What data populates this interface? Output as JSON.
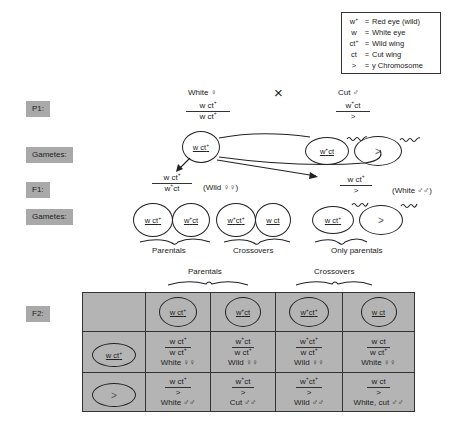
{
  "legend": [
    {
      "symbol": "w+",
      "eq": "=",
      "meaning": "Red eye (wild)"
    },
    {
      "symbol": "w",
      "eq": "=",
      "meaning": "White eye"
    },
    {
      "symbol": "ct+",
      "eq": "=",
      "meaning": "Wild wing"
    },
    {
      "symbol": "ct",
      "eq": "=",
      "meaning": "Cut wing"
    },
    {
      "symbol": ">",
      "eq": "=",
      "meaning": "y Chromosome"
    }
  ],
  "row_labels": {
    "p1": "P1:",
    "gametes1": "Gametes:",
    "f1": "F1:",
    "gametes2": "Gametes:",
    "f2": "F2:"
  },
  "p1": {
    "female_label": "White ♀",
    "female_num": "w ct+",
    "female_den": "w ct+",
    "cross_symbol": "×",
    "male_label": "Cut ♂",
    "male_num": "w+ct",
    "male_den": ">"
  },
  "gametes1": {
    "female": "w ct+",
    "male_x": "w+ct",
    "male_y": ">"
  },
  "f1": {
    "female_num": "w ct+",
    "female_den": "w+ct",
    "female_label": "(Wild ♀♀)",
    "male_num": "w ct+",
    "male_den": ">",
    "male_label": "(White ♂♂)"
  },
  "gametes2": {
    "female": [
      "w ct+",
      "w+ct",
      "w+ct+",
      "w ct"
    ],
    "parentals_label": "Parentals",
    "crossovers_label": "Crossovers",
    "male": [
      "w ct+",
      ">"
    ],
    "only_parentals_label": "Only parentals"
  },
  "f2": {
    "parentals_label": "Parentals",
    "crossovers_label": "Crossovers",
    "column_gametes": [
      "w ct+",
      "w+ct",
      "w+ct+",
      "w ct"
    ],
    "rows": [
      {
        "gamete": "w ct+",
        "cells": [
          {
            "num": "w ct+",
            "den": "w ct+",
            "pheno": "White ♀♀"
          },
          {
            "num": "w+ct",
            "den": "w ct+",
            "pheno": "Wild ♀♀"
          },
          {
            "num": "w+ct+",
            "den": "w ct+",
            "pheno": "Wild ♀♀"
          },
          {
            "num": "w ct",
            "den": "w ct+",
            "pheno": "White ♀♀"
          }
        ]
      },
      {
        "gamete": ">",
        "cells": [
          {
            "num": "w ct+",
            "den": ">",
            "pheno": "White ♂♂"
          },
          {
            "num": "w+ct",
            "den": ">",
            "pheno": "Cut ♂♂"
          },
          {
            "num": "w+ct+",
            "den": ">",
            "pheno": "Wild ♂♂"
          },
          {
            "num": "w ct",
            "den": ">",
            "pheno": "White, cut ♂♂"
          }
        ]
      }
    ]
  }
}
